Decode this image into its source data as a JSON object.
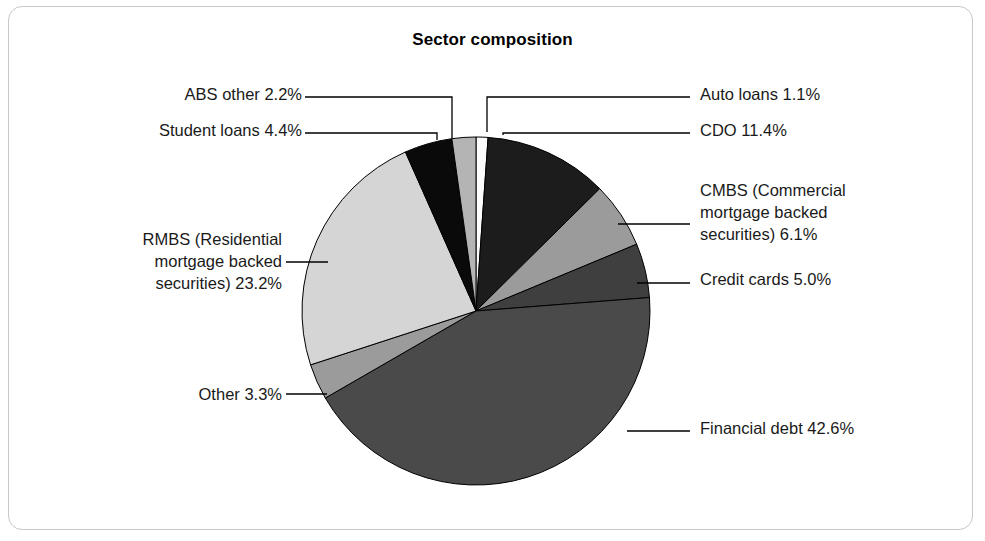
{
  "chart": {
    "title": "Sector composition"
  },
  "chart_data": {
    "type": "pie",
    "title": "Sector composition",
    "xlabel": "",
    "ylabel": "",
    "unit": "%",
    "legend_position": "none",
    "grid": false,
    "start_angle_deg": 0,
    "direction": "clockwise",
    "categories": [
      "Auto loans",
      "CDO",
      "CMBS (Commercial mortgage backed securities)",
      "Credit cards",
      "Financial debt",
      "Other",
      "RMBS (Residential mortgage backed securities)",
      "Student loans",
      "ABS other"
    ],
    "values": [
      1.1,
      11.4,
      6.1,
      5.0,
      42.6,
      3.3,
      23.2,
      4.4,
      2.2
    ],
    "colors": [
      "#fbfbfb",
      "#1c1c1c",
      "#9b9b9b",
      "#3f3f3f",
      "#4a4a4a",
      "#9b9b9b",
      "#d5d5d5",
      "#0a0a0a",
      "#b4b4b4"
    ],
    "slices": [
      {
        "name": "Auto loans",
        "value": 1.1,
        "label": "Auto loans 1.1%",
        "color": "#fbfbfb"
      },
      {
        "name": "CDO",
        "value": 11.4,
        "label": "CDO 11.4%",
        "color": "#1c1c1c"
      },
      {
        "name": "CMBS",
        "value": 6.1,
        "label": "CMBS (Commercial\nmortgage backed\nsecurities) 6.1%",
        "color": "#9b9b9b"
      },
      {
        "name": "Credit cards",
        "value": 5.0,
        "label": "Credit cards 5.0%",
        "color": "#3f3f3f"
      },
      {
        "name": "Financial debt",
        "value": 42.6,
        "label": "Financial debt 42.6%",
        "color": "#4a4a4a"
      },
      {
        "name": "Other",
        "value": 3.3,
        "label": "Other 3.3%",
        "color": "#9b9b9b"
      },
      {
        "name": "RMBS",
        "value": 23.2,
        "label": "RMBS (Residential\nmortgage backed\nsecurities) 23.2%",
        "color": "#d5d5d5"
      },
      {
        "name": "Student loans",
        "value": 4.4,
        "label": "Student loans 4.4%",
        "color": "#0a0a0a"
      },
      {
        "name": "ABS other",
        "value": 2.2,
        "label": "ABS other 2.2%",
        "color": "#b4b4b4"
      }
    ]
  },
  "labels": {
    "abs_other": "ABS other 2.2%",
    "student_loans": "Student loans 4.4%",
    "rmbs": "RMBS (Residential\nmortgage backed\nsecurities) 23.2%",
    "other": "Other 3.3%",
    "auto_loans": "Auto loans 1.1%",
    "cdo": "CDO 11.4%",
    "cmbs": "CMBS (Commercial\nmortgage backed\nsecurities) 6.1%",
    "credit_cards": "Credit cards 5.0%",
    "financial_debt": "Financial debt 42.6%"
  }
}
